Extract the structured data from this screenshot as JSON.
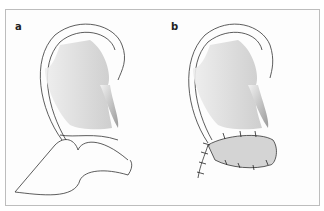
{
  "figure": {
    "panels": [
      {
        "label": "a",
        "description": "Ear with flap outlined below lobule region"
      },
      {
        "label": "b",
        "description": "Flap sutured into defect below ear"
      }
    ]
  }
}
